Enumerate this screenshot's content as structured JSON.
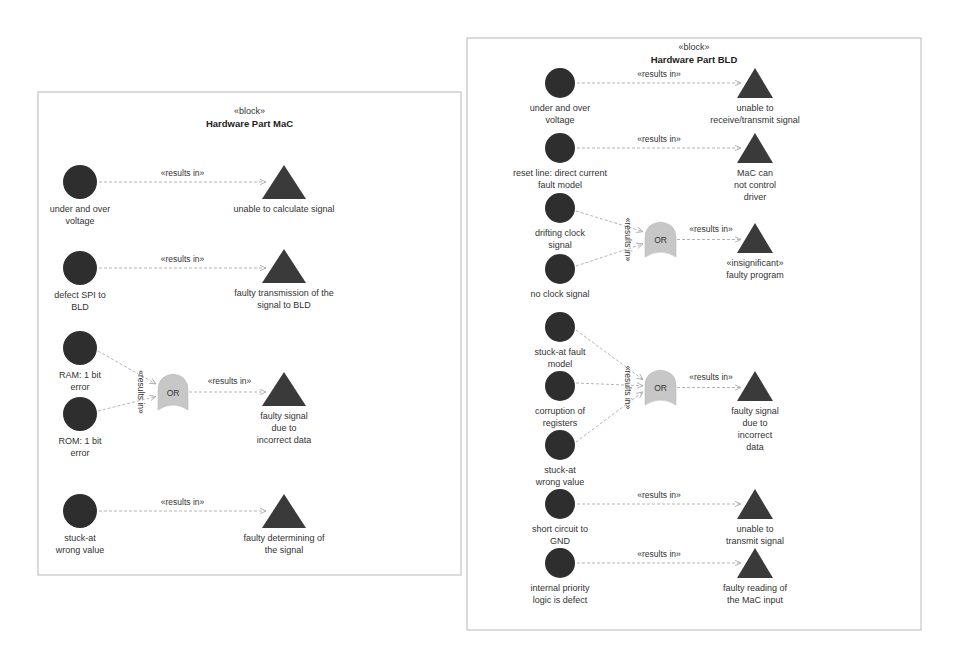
{
  "colors": {
    "cause": "#2e2e2e",
    "effect": "#3a3a3a",
    "gate": "#c7c7c7",
    "edge": "#b5b5b5",
    "frame": "#b8b8b8"
  },
  "blocks": [
    {
      "id": "mac",
      "stereotype": "«block»",
      "title": "Hardware Part MaC",
      "frame": {
        "x": 38,
        "y": 92,
        "w": 423,
        "h": 483
      },
      "causes": [
        {
          "label": [
            "under and over",
            "voltage"
          ],
          "x": 80,
          "y": 182,
          "r": 17
        },
        {
          "label": [
            "defect SPI to",
            "BLD"
          ],
          "x": 80,
          "y": 268,
          "r": 17
        },
        {
          "label": [
            "RAM: 1 bit",
            "error"
          ],
          "x": 80,
          "y": 348,
          "r": 17
        },
        {
          "label": [
            "ROM: 1 bit",
            "error"
          ],
          "x": 80,
          "y": 414,
          "r": 17
        },
        {
          "label": [
            "stuck-at",
            "wrong value"
          ],
          "x": 80,
          "y": 511,
          "r": 17
        }
      ],
      "effects": [
        {
          "label": [
            "unable to calculate signal"
          ],
          "x": 284,
          "y": 165,
          "w": 44,
          "h": 34
        },
        {
          "label": [
            "faulty transmission of the",
            "signal to BLD"
          ],
          "x": 284,
          "y": 249,
          "w": 44,
          "h": 34
        },
        {
          "label": [
            "faulty signal",
            "due to",
            "incorrect data"
          ],
          "x": 284,
          "y": 372,
          "w": 44,
          "h": 34
        },
        {
          "label": [
            "faulty determining of",
            "the signal"
          ],
          "x": 284,
          "y": 494,
          "w": 44,
          "h": 34
        }
      ],
      "gates": [
        {
          "label": "OR",
          "x": 158,
          "y": 374,
          "w": 30,
          "h": 36,
          "inputs_label": "«results in»",
          "inputs": [
            2,
            3
          ],
          "output": 2
        }
      ],
      "direct_links": [
        {
          "from": 0,
          "to": 0,
          "label": "«results in»"
        },
        {
          "from": 1,
          "to": 1,
          "label": "«results in»"
        },
        {
          "from": 4,
          "to": 3,
          "label": "«results in»"
        }
      ],
      "gate_output_label": "«results in»"
    },
    {
      "id": "bld",
      "stereotype": "«block»",
      "title": "Hardware Part BLD",
      "frame": {
        "x": 467,
        "y": 38,
        "w": 454,
        "h": 592
      },
      "causes": [
        {
          "label": [
            "under and over",
            "voltage"
          ],
          "x": 560,
          "y": 83,
          "r": 15
        },
        {
          "label": [
            "reset line: direct current",
            "fault model"
          ],
          "x": 560,
          "y": 148,
          "r": 15
        },
        {
          "label": [
            "drifting clock",
            "signal"
          ],
          "x": 560,
          "y": 208,
          "r": 15
        },
        {
          "label": [
            "no clock signal"
          ],
          "x": 560,
          "y": 269,
          "r": 15
        },
        {
          "label": [
            "stuck-at fault",
            "model"
          ],
          "x": 560,
          "y": 327,
          "r": 15
        },
        {
          "label": [
            "corruption of",
            "registers"
          ],
          "x": 560,
          "y": 386,
          "r": 15
        },
        {
          "label": [
            "stuck-at",
            "wrong value"
          ],
          "x": 560,
          "y": 445,
          "r": 15
        },
        {
          "label": [
            "short circuit to",
            "GND"
          ],
          "x": 560,
          "y": 504,
          "r": 15
        },
        {
          "label": [
            "internal priority",
            "logic is defect"
          ],
          "x": 560,
          "y": 563,
          "r": 15
        }
      ],
      "effects": [
        {
          "label": [
            "unable to",
            "receive/transmit signal"
          ],
          "x": 755,
          "y": 68,
          "w": 36,
          "h": 30
        },
        {
          "label": [
            "MaC can",
            "not control",
            "driver"
          ],
          "x": 755,
          "y": 133,
          "w": 36,
          "h": 30
        },
        {
          "label": [
            "«insignificant»",
            "faulty program"
          ],
          "x": 755,
          "y": 223,
          "w": 36,
          "h": 30
        },
        {
          "label": [
            "faulty signal",
            "due to",
            "incorrect",
            "data"
          ],
          "x": 755,
          "y": 371,
          "w": 36,
          "h": 30
        },
        {
          "label": [
            "unable to",
            "transmit signal"
          ],
          "x": 755,
          "y": 489,
          "w": 36,
          "h": 30
        },
        {
          "label": [
            "faulty reading of",
            "the MaC input"
          ],
          "x": 755,
          "y": 548,
          "w": 36,
          "h": 30
        }
      ],
      "gates": [
        {
          "label": "OR",
          "x": 645,
          "y": 222,
          "w": 31,
          "h": 35,
          "inputs_label": "«results in»",
          "inputs": [
            2,
            3
          ],
          "output": 2
        },
        {
          "label": "OR",
          "x": 645,
          "y": 370,
          "w": 31,
          "h": 35,
          "inputs_label": "«results in»",
          "inputs": [
            4,
            5,
            6
          ],
          "output": 3
        }
      ],
      "direct_links": [
        {
          "from": 0,
          "to": 0,
          "label": "«results in»"
        },
        {
          "from": 1,
          "to": 1,
          "label": "«results in»"
        },
        {
          "from": 7,
          "to": 4,
          "label": "«results in»"
        },
        {
          "from": 8,
          "to": 5,
          "label": "«results in»"
        }
      ],
      "gate_output_label": "«results in»"
    }
  ]
}
